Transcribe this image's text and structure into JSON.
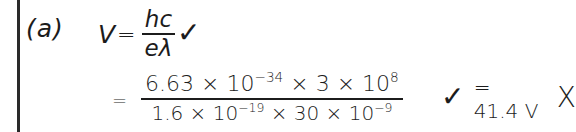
{
  "part": {
    "label": "(a)"
  },
  "equation1": {
    "lhs": "V",
    "equals": "=",
    "numerator": "hc",
    "denominator": "eλ",
    "mark": "✓"
  },
  "equation2": {
    "equals": "=",
    "numerator": {
      "a": "6.63 × 10",
      "a_exp": "−34",
      "b": " × 3 × 10",
      "b_exp": "8"
    },
    "denominator": {
      "a": "1.6 × 10",
      "a_exp": "−19",
      "b": " × 30 × 10",
      "b_exp": "−9"
    },
    "mark": "✓",
    "result": "= 41.4 V",
    "result_mark": "X"
  },
  "colors": {
    "ink": "#1c1c1c",
    "background": "#ffffff",
    "margin_line": "#2a2a2a"
  }
}
